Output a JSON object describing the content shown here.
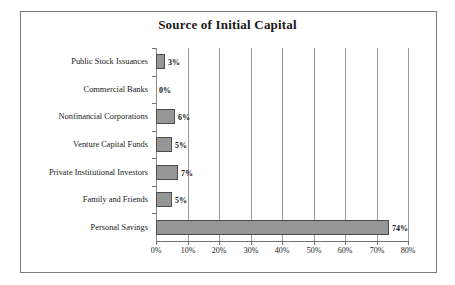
{
  "chart_data": {
    "type": "bar",
    "orientation": "horizontal",
    "title": "Source of Initial Capital",
    "xlabel": "",
    "ylabel": "",
    "categories": [
      "Public Stock Issuances",
      "Commercial Banks",
      "Nonfinancial Corporations",
      "Venture Capital Funds",
      "Private Institutional Investors",
      "Family and Friends",
      "Personal Savings"
    ],
    "values": [
      3,
      0,
      6,
      5,
      7,
      5,
      74
    ],
    "value_labels": [
      "3%",
      "0%",
      "6%",
      "5%",
      "7%",
      "5%",
      "74%"
    ],
    "xlim": [
      0,
      80
    ],
    "xticks": [
      0,
      10,
      20,
      30,
      40,
      50,
      60,
      70,
      80
    ],
    "xticklabels": [
      "0%",
      "10%",
      "20%",
      "30%",
      "40%",
      "50%",
      "60%",
      "70%",
      "80%"
    ],
    "grid": true,
    "legend": false,
    "bar_color": "#969696",
    "bar_edge_color": "#4d4d4d",
    "grid_color": "#9a9a9a",
    "axis_color": "#6f6f6f",
    "text_color": "#1a1a1a",
    "border_color": "#7a7a7a",
    "background": "#ffffff"
  }
}
